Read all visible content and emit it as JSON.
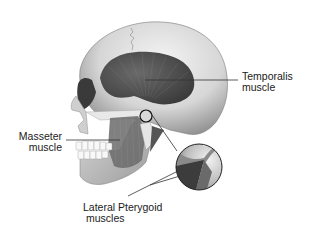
{
  "figure": {
    "labels": {
      "temporalis": {
        "line1": "Temporalis",
        "line2": "muscle"
      },
      "masseter": {
        "line1": "Masseter",
        "line2": "muscle"
      },
      "lateral_pterygoid": {
        "line1": "Lateral Pterygoid",
        "line2": "muscles"
      }
    },
    "inset": {
      "description": "Magnified circular detail of temporomandibular joint"
    },
    "colors": {
      "background": "#ffffff",
      "bone": "#e2e2e2",
      "bone_shadow": "#9a9a9a",
      "muscle": "#4a4a4a",
      "leader_line": "#333333",
      "text": "#1a1a1a"
    }
  }
}
